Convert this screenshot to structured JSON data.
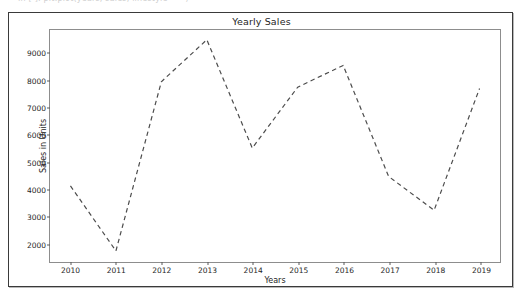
{
  "top_strip": {
    "faded_text": "In [ ]:  plt.plot(years, sales, linestyle='--')"
  },
  "figure": {
    "title": "Yearly Sales",
    "frame_color": "#3a3a3a",
    "axes_color": "#8d8d8d",
    "background": "#ffffff"
  },
  "chart_data": {
    "type": "line",
    "title": "Yearly Sales",
    "xlabel": "Years",
    "ylabel": "Sales in Units",
    "x": [
      2010,
      2011,
      2012,
      2013,
      2014,
      2015,
      2016,
      2017,
      2018,
      2019
    ],
    "xtick_labels": [
      "2010",
      "2011",
      "2012",
      "2013",
      "2014",
      "2015",
      "2016",
      "2017",
      "2018",
      "2019"
    ],
    "values": [
      4100,
      1700,
      7950,
      9500,
      5500,
      7750,
      8550,
      4450,
      3200,
      7700
    ],
    "ytick_values": [
      2000,
      3000,
      4000,
      5000,
      6000,
      7000,
      8000,
      9000
    ],
    "ytick_labels": [
      "2000",
      "3000",
      "4000",
      "5000",
      "6000",
      "7000",
      "8000",
      "9000"
    ],
    "xlim": [
      2009.55,
      2019.45
    ],
    "ylim": [
      1290,
      9860
    ],
    "grid": false,
    "legend": null,
    "series": [
      {
        "name": "Sales in Units",
        "color": "#4c4c4c",
        "linestyle": "dashed",
        "linewidth": 1.2,
        "marker": "none",
        "values": [
          4100,
          1700,
          7950,
          9500,
          5500,
          7750,
          8550,
          4450,
          3200,
          7700
        ]
      }
    ]
  }
}
